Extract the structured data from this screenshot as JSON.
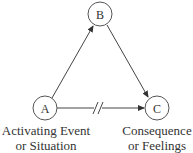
{
  "diagram": {
    "nodes": [
      {
        "id": "A",
        "label": "A",
        "caption_line1": "Activating Event",
        "caption_line2": "or Situation"
      },
      {
        "id": "B",
        "label": "B"
      },
      {
        "id": "C",
        "label": "C",
        "caption_line1": "Consequence",
        "caption_line2": "or Feelings"
      }
    ],
    "edges": [
      {
        "from": "A",
        "to": "B",
        "style": "arrow"
      },
      {
        "from": "B",
        "to": "C",
        "style": "arrow"
      },
      {
        "from": "A",
        "to": "C",
        "style": "arrow-broken",
        "note": "double slash break mark"
      }
    ],
    "colors": {
      "stroke": "#444444",
      "text": "#333333",
      "background": "#ffffff"
    }
  }
}
